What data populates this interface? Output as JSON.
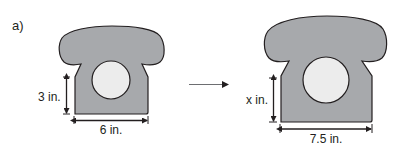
{
  "part_label": "a)",
  "colors": {
    "phone_fill": "#a7a9ac",
    "dial_fill": "#ececec",
    "outline": "#231f20",
    "arrow": "#6d6e71"
  },
  "original": {
    "height_label": "3 in.",
    "width_label": "6 in."
  },
  "enlarged": {
    "height_label": "x in.",
    "width_label": "7.5 in."
  }
}
